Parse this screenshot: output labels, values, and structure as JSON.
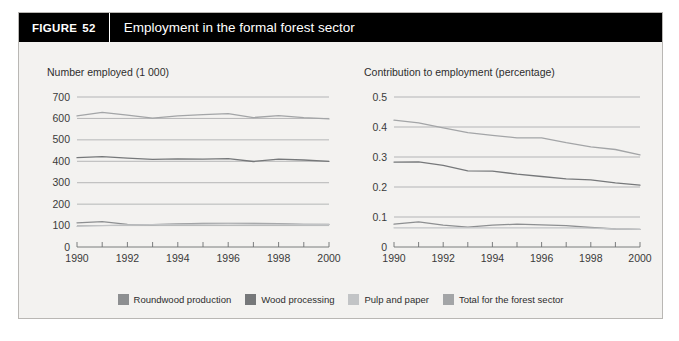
{
  "figure": {
    "number_label": "FIGURE",
    "number": "52",
    "title": "Employment in the formal forest sector"
  },
  "legend": {
    "items": [
      {
        "label": "Roundwood production",
        "color": "#8d8f91",
        "icon": "legend-swatch"
      },
      {
        "label": "Wood processing",
        "color": "#76787a",
        "icon": "legend-swatch"
      },
      {
        "label": "Pulp and paper",
        "color": "#c2c4c6",
        "icon": "legend-swatch"
      },
      {
        "label": "Total for the forest sector",
        "color": "#a3a5a7",
        "icon": "legend-swatch"
      }
    ]
  },
  "chart_data": [
    {
      "id": "number-employed",
      "type": "line",
      "title": "Number employed (1 000)",
      "xlabel": "",
      "ylabel": "Number employed (1 000)",
      "x": [
        1990,
        1991,
        1992,
        1993,
        1994,
        1995,
        1996,
        1997,
        1998,
        1999,
        2000
      ],
      "xticklabels": [
        "1990",
        "",
        "1992",
        "",
        "1994",
        "",
        "1996",
        "",
        "1998",
        "",
        "2000"
      ],
      "xlim": [
        1990,
        2000
      ],
      "ylim": [
        0,
        700
      ],
      "yticks": [
        0,
        100,
        200,
        300,
        400,
        500,
        600,
        700
      ],
      "yticklabels": [
        "0",
        "100",
        "200",
        "300",
        "400",
        "500",
        "600",
        "700"
      ],
      "grid": true,
      "legend_position": "bottom",
      "series": [
        {
          "name": "Total for the forest sector",
          "color": "#a3a5a7",
          "values": [
            612,
            628,
            615,
            601,
            612,
            618,
            622,
            604,
            613,
            604,
            598
          ]
        },
        {
          "name": "Wood processing",
          "color": "#76787a",
          "values": [
            417,
            422,
            415,
            409,
            411,
            410,
            412,
            399,
            410,
            406,
            400
          ]
        },
        {
          "name": "Roundwood production",
          "color": "#8d8f91",
          "values": [
            113,
            118,
            106,
            104,
            108,
            110,
            110,
            110,
            109,
            106,
            106
          ]
        },
        {
          "name": "Pulp and paper",
          "color": "#c2c4c6",
          "values": [
            96,
            100,
            103,
            104,
            106,
            107,
            108,
            107,
            107,
            105,
            104
          ]
        }
      ]
    },
    {
      "id": "contribution-to-employment",
      "type": "line",
      "title": "Contribution to employment (percentage)",
      "xlabel": "",
      "ylabel": "Contribution to employment (percentage)",
      "x": [
        1990,
        1991,
        1992,
        1993,
        1994,
        1995,
        1996,
        1997,
        1998,
        1999,
        2000
      ],
      "xticklabels": [
        "1990",
        "",
        "1992",
        "",
        "1994",
        "",
        "1996",
        "",
        "1998",
        "",
        "2000"
      ],
      "xlim": [
        1990,
        2000
      ],
      "ylim": [
        0,
        0.5
      ],
      "yticks": [
        0,
        0.1,
        0.2,
        0.3,
        0.4,
        0.5
      ],
      "yticklabels": [
        "0",
        "0.1",
        "0.2",
        "0.3",
        "0.4",
        "0.5"
      ],
      "grid": true,
      "legend_position": "bottom",
      "series": [
        {
          "name": "Total for the forest sector",
          "color": "#a3a5a7",
          "values": [
            0.423,
            0.414,
            0.397,
            0.381,
            0.372,
            0.364,
            0.364,
            0.348,
            0.334,
            0.325,
            0.307
          ]
        },
        {
          "name": "Wood processing",
          "color": "#76787a",
          "values": [
            0.283,
            0.284,
            0.272,
            0.254,
            0.253,
            0.243,
            0.235,
            0.227,
            0.224,
            0.214,
            0.206
          ]
        },
        {
          "name": "Roundwood production",
          "color": "#8d8f91",
          "values": [
            0.076,
            0.084,
            0.073,
            0.066,
            0.073,
            0.076,
            0.074,
            0.071,
            0.065,
            0.06,
            0.059
          ]
        },
        {
          "name": "Pulp and paper",
          "color": "#c2c4c6",
          "values": [
            0.064,
            0.064,
            0.064,
            0.064,
            0.064,
            0.064,
            0.064,
            0.064,
            0.063,
            0.06,
            0.059
          ]
        }
      ]
    }
  ]
}
